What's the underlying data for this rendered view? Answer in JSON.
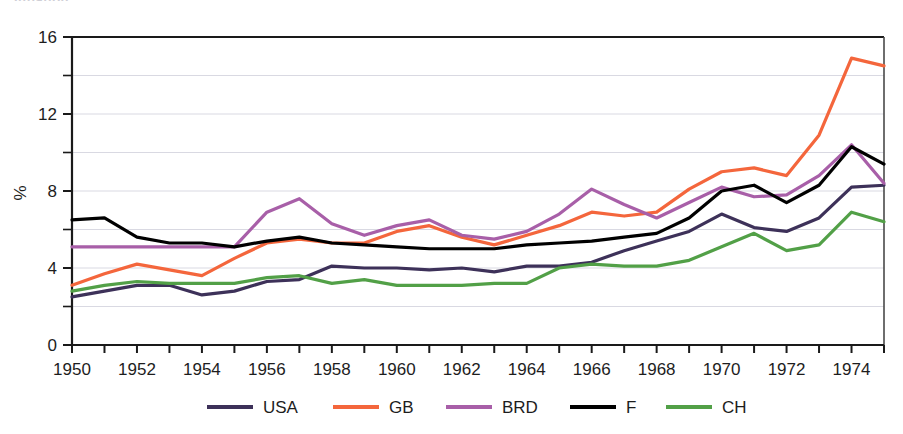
{
  "title_clipped": "Inflation",
  "chart_data": {
    "type": "line",
    "title": "",
    "xlabel": "",
    "ylabel": "%",
    "xlim": [
      1950,
      1975
    ],
    "ylim": [
      0,
      16
    ],
    "grid": true,
    "legend_position": "bottom",
    "y_ticks": [
      0,
      4,
      8,
      12,
      16
    ],
    "y_minor_ticks": [
      2,
      6,
      10,
      14
    ],
    "x_ticks": [
      1950,
      1952,
      1954,
      1956,
      1958,
      1960,
      1962,
      1964,
      1966,
      1968,
      1970,
      1972,
      1974
    ],
    "x_minor_ticks": [
      1951,
      1953,
      1955,
      1957,
      1959,
      1961,
      1963,
      1965,
      1967,
      1969,
      1971,
      1973,
      1975
    ],
    "x": [
      1950,
      1951,
      1952,
      1953,
      1954,
      1955,
      1956,
      1957,
      1958,
      1959,
      1960,
      1961,
      1962,
      1963,
      1964,
      1965,
      1966,
      1967,
      1968,
      1969,
      1970,
      1971,
      1972,
      1973,
      1974,
      1975
    ],
    "series": [
      {
        "name": "USA",
        "color": "#3d3159",
        "values": [
          2.5,
          2.8,
          3.1,
          3.1,
          2.6,
          2.8,
          3.3,
          3.4,
          4.1,
          4.0,
          4.0,
          3.9,
          4.0,
          3.8,
          4.1,
          4.1,
          4.3,
          4.9,
          5.4,
          5.9,
          6.8,
          6.1,
          5.9,
          6.6,
          8.2,
          8.3
        ]
      },
      {
        "name": "GB",
        "color": "#f4663c",
        "values": [
          3.1,
          3.7,
          4.2,
          3.9,
          3.6,
          4.5,
          5.3,
          5.5,
          5.3,
          5.3,
          5.9,
          6.2,
          5.6,
          5.2,
          5.7,
          6.2,
          6.9,
          6.7,
          6.9,
          8.1,
          9.0,
          9.2,
          8.8,
          10.9,
          14.9,
          14.5
        ]
      },
      {
        "name": "BRD",
        "color": "#a85fa8",
        "values": [
          5.1,
          5.1,
          5.1,
          5.1,
          5.1,
          5.1,
          6.9,
          7.6,
          6.3,
          5.7,
          6.2,
          6.5,
          5.7,
          5.5,
          5.9,
          6.8,
          8.1,
          7.3,
          6.6,
          7.4,
          8.2,
          7.7,
          7.8,
          8.8,
          10.4,
          8.4
        ]
      },
      {
        "name": "F",
        "color": "#000000",
        "values": [
          6.5,
          6.6,
          5.6,
          5.3,
          5.3,
          5.1,
          5.4,
          5.6,
          5.3,
          5.2,
          5.1,
          5.0,
          5.0,
          5.0,
          5.2,
          5.3,
          5.4,
          5.6,
          5.8,
          6.6,
          8.0,
          8.3,
          7.4,
          8.3,
          10.3,
          9.4
        ]
      },
      {
        "name": "CH",
        "color": "#52a047",
        "values": [
          2.8,
          3.1,
          3.3,
          3.2,
          3.2,
          3.2,
          3.5,
          3.6,
          3.2,
          3.4,
          3.1,
          3.1,
          3.1,
          3.2,
          3.2,
          4.0,
          4.2,
          4.1,
          4.1,
          4.4,
          5.1,
          5.8,
          4.9,
          5.2,
          6.9,
          6.4
        ]
      }
    ]
  },
  "legend": {
    "items": [
      {
        "label": "USA",
        "color": "#3d3159"
      },
      {
        "label": "GB",
        "color": "#f4663c"
      },
      {
        "label": "BRD",
        "color": "#a85fa8"
      },
      {
        "label": "F",
        "color": "#000000"
      },
      {
        "label": "CH",
        "color": "#52a047"
      }
    ]
  }
}
